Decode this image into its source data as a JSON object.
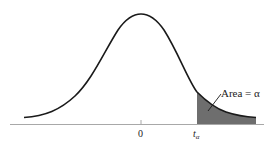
{
  "figure": {
    "type": "t-distribution density with shaded upper tail",
    "area_label": "Area = α",
    "center_tick_label": "0",
    "critical_label_main": "t",
    "critical_label_sub": "α",
    "colors": {
      "curve": "#1a1a1a",
      "shade": "#6e6e6e",
      "axis": "#9a9a9a",
      "background": "#ffffff"
    }
  }
}
